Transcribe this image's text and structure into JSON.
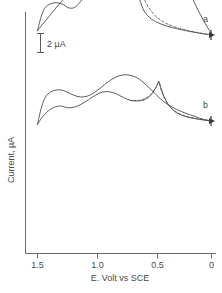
{
  "chart_data": {
    "type": "line",
    "title": "",
    "subtitle": "",
    "xlabel": "E. Volt vs SCE",
    "ylabel": "Current, µA",
    "xlim": [
      1.6,
      -0.05
    ],
    "x_ticks": [
      1.5,
      1.0,
      0.5,
      0
    ],
    "x_tick_labels": [
      "1.5",
      "1.0",
      "0.5",
      "0"
    ],
    "y_ticks": [],
    "y_tick_labels": [],
    "ylim_note": "arbitrary current axis, calibrated only by scale bar",
    "grid": false,
    "legend_position": "inline-right",
    "axis_direction_note": "potential axis reversed: 1.5 V at left, 0 V at right",
    "scale_bar": {
      "label": "2 µA",
      "value": 2,
      "units": "µA",
      "orientation": "vertical"
    },
    "annotations": [
      {
        "text": "a",
        "x": 0.02,
        "series": "upper-voltammogram"
      },
      {
        "text": "b",
        "x": 0.02,
        "series": "lower-voltammogram"
      }
    ],
    "series": [
      {
        "name": "a",
        "label": "a",
        "style": "solid",
        "description": "cyclic voltammogram a, anodic scan with shoulder near 1.15 V and sharp peak near 0.68 V; cathodic return with reduction wave near 0.55 V",
        "forward_scan": [
          [
            0.0,
            0.0
          ],
          [
            0.06,
            0.06
          ],
          [
            0.14,
            0.15
          ],
          [
            0.24,
            0.28
          ],
          [
            0.34,
            0.44
          ],
          [
            0.44,
            0.66
          ],
          [
            0.52,
            0.95
          ],
          [
            0.58,
            1.4
          ],
          [
            0.62,
            2.1
          ],
          [
            0.655,
            2.95
          ],
          [
            0.675,
            3.45
          ],
          [
            0.7,
            3.2
          ],
          [
            0.74,
            2.75
          ],
          [
            0.8,
            2.5
          ],
          [
            0.88,
            2.42
          ],
          [
            0.96,
            2.4
          ],
          [
            1.04,
            2.44
          ],
          [
            1.1,
            2.52
          ],
          [
            1.16,
            2.55
          ],
          [
            1.22,
            2.42
          ],
          [
            1.28,
            2.05
          ],
          [
            1.34,
            1.6
          ],
          [
            1.4,
            1.1
          ],
          [
            1.46,
            0.6
          ],
          [
            1.5,
            0.25
          ]
        ],
        "reverse_scan": [
          [
            1.5,
            0.25
          ],
          [
            1.47,
            1.05
          ],
          [
            1.44,
            1.55
          ],
          [
            1.4,
            1.8
          ],
          [
            1.34,
            1.9
          ],
          [
            1.28,
            1.8
          ],
          [
            1.24,
            1.62
          ],
          [
            1.2,
            1.58
          ],
          [
            1.16,
            1.72
          ],
          [
            1.12,
            2.05
          ],
          [
            1.06,
            2.55
          ],
          [
            0.98,
            3.2
          ],
          [
            0.9,
            3.8
          ],
          [
            0.82,
            4.3
          ],
          [
            0.74,
            4.7
          ],
          [
            0.66,
            5.05
          ],
          [
            0.58,
            5.3
          ],
          [
            0.5,
            5.35
          ],
          [
            0.44,
            5.2
          ],
          [
            0.38,
            4.85
          ],
          [
            0.32,
            4.3
          ],
          [
            0.26,
            3.55
          ],
          [
            0.2,
            2.7
          ],
          [
            0.14,
            1.8
          ],
          [
            0.08,
            1.0
          ],
          [
            0.03,
            0.4
          ],
          [
            0.0,
            0.1
          ]
        ]
      },
      {
        "name": "b",
        "label": "b",
        "style": "solid",
        "description": "cyclic voltammogram b, anodic scan with sharp peak near 0.45 V, broad wave near 0.85 V and shoulder near 1.25 V; cathodic return with reduction features near 0.55 V and 1.25 V",
        "forward_scan": [
          [
            0.0,
            0.0
          ],
          [
            0.06,
            0.05
          ],
          [
            0.14,
            0.14
          ],
          [
            0.22,
            0.26
          ],
          [
            0.3,
            0.48
          ],
          [
            0.36,
            0.85
          ],
          [
            0.41,
            1.45
          ],
          [
            0.44,
            2.05
          ],
          [
            0.455,
            2.35
          ],
          [
            0.47,
            2.1
          ],
          [
            0.52,
            1.55
          ],
          [
            0.58,
            1.25
          ],
          [
            0.64,
            1.18
          ],
          [
            0.7,
            1.22
          ],
          [
            0.76,
            1.38
          ],
          [
            0.82,
            1.6
          ],
          [
            0.88,
            1.72
          ],
          [
            0.94,
            1.7
          ],
          [
            1.0,
            1.52
          ],
          [
            1.06,
            1.25
          ],
          [
            1.12,
            1.0
          ],
          [
            1.18,
            0.82
          ],
          [
            1.24,
            0.78
          ],
          [
            1.3,
            0.88
          ],
          [
            1.36,
            0.8
          ],
          [
            1.42,
            0.52
          ],
          [
            1.47,
            0.12
          ],
          [
            1.5,
            -0.2
          ]
        ],
        "reverse_scan": [
          [
            1.5,
            -0.2
          ],
          [
            1.47,
            0.7
          ],
          [
            1.44,
            1.3
          ],
          [
            1.4,
            1.65
          ],
          [
            1.34,
            1.82
          ],
          [
            1.28,
            1.8
          ],
          [
            1.22,
            1.62
          ],
          [
            1.16,
            1.45
          ],
          [
            1.1,
            1.42
          ],
          [
            1.04,
            1.55
          ],
          [
            0.98,
            1.82
          ],
          [
            0.92,
            2.15
          ],
          [
            0.86,
            2.45
          ],
          [
            0.8,
            2.65
          ],
          [
            0.74,
            2.72
          ],
          [
            0.68,
            2.65
          ],
          [
            0.62,
            2.45
          ],
          [
            0.56,
            2.1
          ],
          [
            0.5,
            1.7
          ],
          [
            0.44,
            1.3
          ],
          [
            0.38,
            0.98
          ],
          [
            0.3,
            0.68
          ],
          [
            0.22,
            0.45
          ],
          [
            0.14,
            0.26
          ],
          [
            0.07,
            0.1
          ],
          [
            0.0,
            0.0
          ]
        ]
      },
      {
        "name": "a-baseline",
        "label": "",
        "style": "dashed",
        "description": "dashed extrapolated baseline under peak of voltammogram a",
        "points": [
          [
            0.0,
            0.02
          ],
          [
            0.1,
            0.12
          ],
          [
            0.2,
            0.26
          ],
          [
            0.3,
            0.44
          ],
          [
            0.4,
            0.72
          ],
          [
            0.48,
            1.1
          ],
          [
            0.54,
            1.6
          ],
          [
            0.58,
            2.1
          ],
          [
            0.62,
            2.55
          ],
          [
            0.655,
            2.9
          ],
          [
            0.675,
            3.3
          ],
          [
            0.7,
            3.0
          ],
          [
            0.76,
            2.6
          ],
          [
            0.84,
            2.44
          ],
          [
            0.92,
            2.4
          ]
        ]
      },
      {
        "name": "b-baseline",
        "label": "",
        "style": "dashed",
        "description": "dashed extrapolated baseline under peak of voltammogram b",
        "points": [
          [
            0.0,
            0.02
          ],
          [
            0.08,
            0.08
          ],
          [
            0.16,
            0.18
          ],
          [
            0.24,
            0.32
          ],
          [
            0.3,
            0.52
          ],
          [
            0.36,
            0.85
          ],
          [
            0.41,
            1.4
          ],
          [
            0.44,
            1.95
          ],
          [
            0.455,
            2.28
          ],
          [
            0.48,
            1.95
          ],
          [
            0.54,
            1.45
          ],
          [
            0.62,
            1.22
          ],
          [
            0.7,
            1.2
          ]
        ]
      }
    ]
  },
  "axes": {
    "x_title": "E. Volt vs SCE",
    "y_title": "Current, µA",
    "x_tick_labels": [
      "1.5",
      "1.0",
      "0.5",
      "0"
    ]
  },
  "labels": {
    "curve_a": "a",
    "curve_b": "b",
    "scale_bar": "2 µA"
  },
  "colors": {
    "line": "#4a4a4a",
    "axis": "#6b6b6b",
    "text": "#4a4a4a",
    "background": "#ffffff"
  }
}
